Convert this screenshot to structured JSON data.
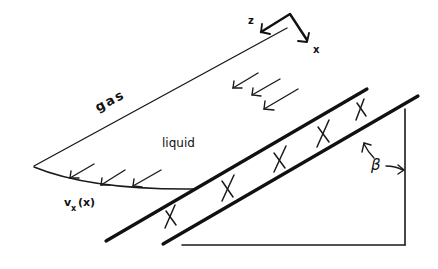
{
  "diagram": {
    "labels": {
      "gas": "gas",
      "liquid": "liquid",
      "velocity_profile": "v",
      "velocity_subscript": "x",
      "velocity_arg": "(x)",
      "angle": "β",
      "axis_z": "z",
      "axis_x": "x"
    },
    "elements": {
      "gas_liquid_interface": "thin line",
      "velocity_profile_arrows": 3,
      "flow_arrows": 3,
      "plate_hatch_marks": 6,
      "plate": "two thick parallel lines",
      "support_triangle": "vertical and horizontal lines"
    },
    "colors": {
      "ink": "#111111",
      "background": "#ffffff"
    }
  }
}
